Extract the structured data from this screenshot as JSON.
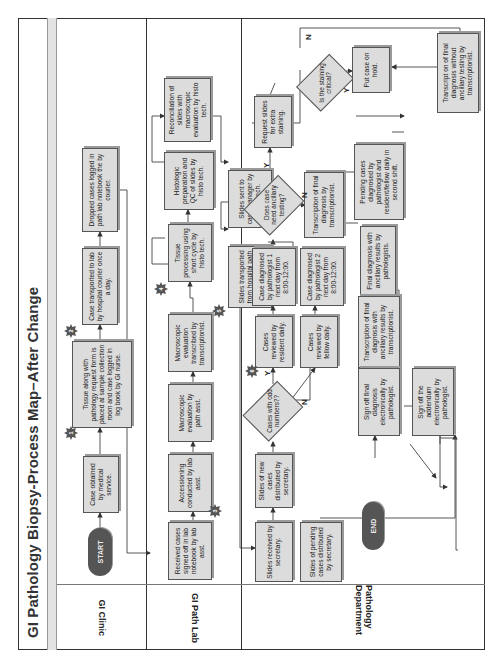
{
  "title": "GI Pathology Biopsy-Process Map–After Change",
  "lanes": [
    {
      "label": "GI Clinic"
    },
    {
      "label": "GI Path Lab"
    },
    {
      "label": "Pathology Department"
    }
  ],
  "terminals": {
    "start": "START",
    "end": "END"
  },
  "steps": {
    "case_obtained": "Case obtained by medical service.",
    "tissue_placed": "Tissue along with pathology request form is placed at sample collection room and case logged in log book by GI nurse.",
    "case_transported": "Case transported to lab by hospital courier once a day.",
    "dropped_logged": "Dropped cases logged in path lab notebook the by courier.",
    "received_signed": "Received cases signed off in lab notebook by lab asst.",
    "accessioning": "Accessioning conducted by lab asst.",
    "macroscopic_eval": "Macroscopic evaluation by path asst.",
    "macroscopic_transcribed": "Macroscopic evaluation transcribed by transcriptionist.",
    "tissue_processing": "Tissue processing using short cycle by histo tech.",
    "histologic_prep": "Histologic preparation and QC of slides by histo tech.",
    "reconciliation": "Reconciliation of slides with macroscopic evaluation by histo tech.",
    "slides_sent": "Slides sent to case manager by histo tech.",
    "slides_transported": "Slides transported from hospital path lab by AP courier.",
    "slides_received": "Slides received by secretary.",
    "slides_new_distributed": "Slides of new cases distributed by secretary.",
    "slides_pending_distributed": "Slides of pending cases distributed by secretary.",
    "reviewed_resident": "Cases reviewed by resident daily.",
    "reviewed_fellow": "Cases reviewed by fellow daily.",
    "diagnosed_p1": "Case diagnosed by pathologist 1 next day from 8:00-12:00.",
    "diagnosed_p2": "Case diagnosed by pathologist 2 next day from 8:00-12:00.",
    "transcription_final": "Transcription of final diagnosis by transcriptionist.",
    "request_slides": "Request slides for extra staining.",
    "put_on_hold": "Put case on hold.",
    "transcript_without": "Transcript on of final diagnosis without ancillary testing by transcriptionist.",
    "pending_diagnosed": "Pending cases diagnosed by pathologist and resident/fellow daily in second shift.",
    "final_with_ancillary": "Final diagnosis with ancillary results by pathologists.",
    "transcription_with_ancillary": "Transcription of final diagnosis with ancillary results by transcriptionist.",
    "sign_off_final": "Sign off final diagnosis electronically by pathologist.",
    "sign_off_addendum": "Sign off the addendum electronically by pathologist."
  },
  "decisions": {
    "odd_numbers": "Cases with odd numbers??",
    "ancillary": "Does case need ancillary testing?",
    "staining_critical": "Is the staining critical?"
  },
  "branch_labels": {
    "yes": "Y",
    "no": "N"
  },
  "markers": [
    "1",
    "2",
    "3",
    "4",
    "5",
    "6"
  ]
}
